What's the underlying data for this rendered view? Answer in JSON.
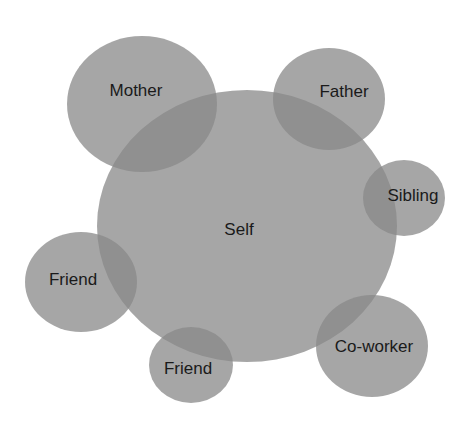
{
  "diagram": {
    "type": "relationship-circles",
    "fill_color": "#888888",
    "label_color": "#1a1a1a",
    "nodes": [
      {
        "id": "self",
        "label": "Self",
        "cx": 247,
        "cy": 226,
        "rx": 150,
        "ry": 136,
        "lx": 239,
        "ly": 231
      },
      {
        "id": "mother",
        "label": "Mother",
        "cx": 142,
        "cy": 104,
        "rx": 75,
        "ry": 68,
        "lx": 136,
        "ly": 92
      },
      {
        "id": "father",
        "label": "Father",
        "cx": 329,
        "cy": 99,
        "rx": 56,
        "ry": 51,
        "lx": 344,
        "ly": 93
      },
      {
        "id": "sibling",
        "label": "Sibling",
        "cx": 404,
        "cy": 198,
        "rx": 41,
        "ry": 38,
        "lx": 413,
        "ly": 197
      },
      {
        "id": "friend-left",
        "label": "Friend",
        "cx": 81,
        "cy": 282,
        "rx": 56,
        "ry": 50,
        "lx": 73,
        "ly": 281
      },
      {
        "id": "friend-bottom",
        "label": "Friend",
        "cx": 191,
        "cy": 365,
        "rx": 42,
        "ry": 38,
        "lx": 188,
        "ly": 370
      },
      {
        "id": "coworker",
        "label": "Co-worker",
        "cx": 372,
        "cy": 346,
        "rx": 56,
        "ry": 51,
        "lx": 374,
        "ly": 348
      }
    ]
  }
}
